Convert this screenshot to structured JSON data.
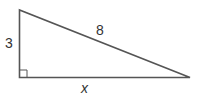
{
  "diagram": {
    "type": "right-triangle",
    "labels": {
      "vertical_leg": "3",
      "hypotenuse": "8",
      "horizontal_leg": "x"
    },
    "right_angle_marker": true,
    "stroke_color": "#555555"
  }
}
